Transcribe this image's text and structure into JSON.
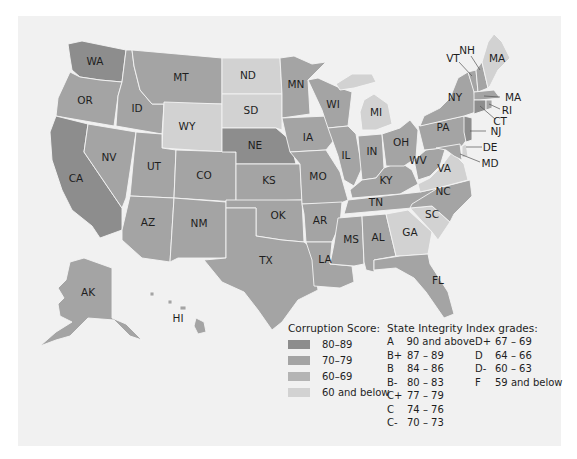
{
  "colors": {
    "panel_bg": "#f1f1f1",
    "score_80_89": "#8d8d8d",
    "score_70_79": "#a4a4a4",
    "score_60_69": "#b4b4b4",
    "score_60_below": "#d2d2d2"
  },
  "states": [
    {
      "abbr": "WA",
      "category": "score_80_89"
    },
    {
      "abbr": "OR",
      "category": "score_70_79"
    },
    {
      "abbr": "CA",
      "category": "score_80_89"
    },
    {
      "abbr": "ID",
      "category": "score_70_79"
    },
    {
      "abbr": "NV",
      "category": "score_70_79"
    },
    {
      "abbr": "MT",
      "category": "score_70_79"
    },
    {
      "abbr": "WY",
      "category": "score_60_below"
    },
    {
      "abbr": "UT",
      "category": "score_70_79"
    },
    {
      "abbr": "AZ",
      "category": "score_70_79"
    },
    {
      "abbr": "CO",
      "category": "score_70_79"
    },
    {
      "abbr": "NM",
      "category": "score_70_79"
    },
    {
      "abbr": "ND",
      "category": "score_60_below"
    },
    {
      "abbr": "SD",
      "category": "score_60_below"
    },
    {
      "abbr": "NE",
      "category": "score_80_89"
    },
    {
      "abbr": "KS",
      "category": "score_70_79"
    },
    {
      "abbr": "OK",
      "category": "score_70_79"
    },
    {
      "abbr": "TX",
      "category": "score_70_79"
    },
    {
      "abbr": "MN",
      "category": "score_70_79"
    },
    {
      "abbr": "IA",
      "category": "score_70_79"
    },
    {
      "abbr": "MO",
      "category": "score_70_79"
    },
    {
      "abbr": "AR",
      "category": "score_70_79"
    },
    {
      "abbr": "LA",
      "category": "score_70_79"
    },
    {
      "abbr": "WI",
      "category": "score_70_79"
    },
    {
      "abbr": "IL",
      "category": "score_70_79"
    },
    {
      "abbr": "MS",
      "category": "score_70_79"
    },
    {
      "abbr": "MI",
      "category": "score_60_below"
    },
    {
      "abbr": "IN",
      "category": "score_70_79"
    },
    {
      "abbr": "KY",
      "category": "score_70_79"
    },
    {
      "abbr": "TN",
      "category": "score_70_79"
    },
    {
      "abbr": "AL",
      "category": "score_70_79"
    },
    {
      "abbr": "OH",
      "category": "score_70_79"
    },
    {
      "abbr": "GA",
      "category": "score_60_below"
    },
    {
      "abbr": "FL",
      "category": "score_70_79"
    },
    {
      "abbr": "SC",
      "category": "score_60_below"
    },
    {
      "abbr": "NC",
      "category": "score_70_79"
    },
    {
      "abbr": "VA",
      "category": "score_60_below"
    },
    {
      "abbr": "WV",
      "category": "score_70_79"
    },
    {
      "abbr": "PA",
      "category": "score_70_79"
    },
    {
      "abbr": "NY",
      "category": "score_70_79"
    },
    {
      "abbr": "VT",
      "category": "score_70_79"
    },
    {
      "abbr": "NH",
      "category": "score_70_79"
    },
    {
      "abbr": "MA",
      "category": "score_60_below",
      "note": "Maine, labeled MA on map"
    },
    {
      "abbr": "MA",
      "category": "score_70_79"
    },
    {
      "abbr": "RI",
      "category": "score_70_79"
    },
    {
      "abbr": "CT",
      "category": "score_80_89"
    },
    {
      "abbr": "NJ",
      "category": "score_80_89"
    },
    {
      "abbr": "DE",
      "category": "score_60_below"
    },
    {
      "abbr": "MD",
      "category": "score_70_79"
    },
    {
      "abbr": "AK",
      "category": "score_70_79"
    },
    {
      "abbr": "HI",
      "category": "score_70_79"
    }
  ],
  "labels": {
    "WA": "WA",
    "OR": "OR",
    "CA": "CA",
    "ID": "ID",
    "NV": "NV",
    "MT": "MT",
    "WY": "WY",
    "UT": "UT",
    "AZ": "AZ",
    "CO": "CO",
    "NM": "NM",
    "ND": "ND",
    "SD": "SD",
    "NE": "NE",
    "KS": "KS",
    "OK": "OK",
    "TX": "TX",
    "MN": "MN",
    "IA": "IA",
    "MO": "MO",
    "AR": "AR",
    "LA": "LA",
    "WI": "WI",
    "IL": "IL",
    "MS": "MS",
    "MI": "MI",
    "IN": "IN",
    "KY": "KY",
    "TN": "TN",
    "AL": "AL",
    "OH": "OH",
    "GA": "GA",
    "FL": "FL",
    "SC": "SC",
    "NC": "NC",
    "VA": "VA",
    "WV": "WV",
    "PA": "PA",
    "NY": "NY",
    "VT": "VT",
    "NH": "NH",
    "ME": "MA",
    "MA": "MA",
    "RI": "RI",
    "CT": "CT",
    "NJ": "NJ",
    "DE": "DE",
    "MD": "MD",
    "AK": "AK",
    "HI": "HI"
  },
  "score_legend": {
    "title": "Corruption Score:",
    "items": [
      {
        "label": "80–89",
        "color": "#8d8d8d"
      },
      {
        "label": "70–79",
        "color": "#a4a4a4"
      },
      {
        "label": "60–69",
        "color": "#b4b4b4"
      },
      {
        "label": "60 and below",
        "color": "#d2d2d2"
      }
    ]
  },
  "grade_legend": {
    "title": "State Integrity Index grades:",
    "items": [
      {
        "grade": "A",
        "range": "90 and above"
      },
      {
        "grade": "B+",
        "range": "87 – 89"
      },
      {
        "grade": "B",
        "range": "84 – 86"
      },
      {
        "grade": "B-",
        "range": "80 – 83"
      },
      {
        "grade": "C+",
        "range": "77 – 79"
      },
      {
        "grade": "C",
        "range": "74 – 76"
      },
      {
        "grade": "C-",
        "range": "70 – 73"
      },
      {
        "grade": "D+",
        "range": "67 – 69"
      },
      {
        "grade": "D",
        "range": "64 – 66"
      },
      {
        "grade": "D-",
        "range": "60 – 63"
      },
      {
        "grade": "F",
        "range": "59 and below"
      }
    ]
  }
}
